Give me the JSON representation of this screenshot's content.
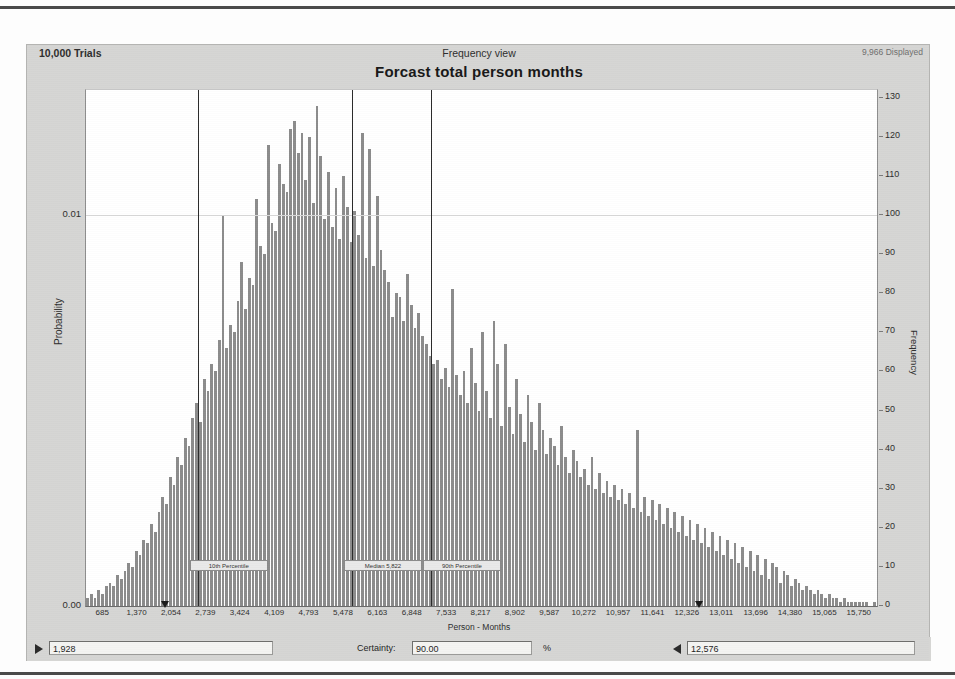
{
  "window": {
    "trials_label": "10,000 Trials",
    "view_label": "Frequency view",
    "displayed_label": "9,966 Displayed",
    "chart_title": "Forcast total person months"
  },
  "controls": {
    "lower_bound_value": "1,928",
    "certainty_label": "Certainty:",
    "certainty_value": "90.00",
    "percent_symbol": "%",
    "upper_bound_value": "12,576",
    "left_grabber_icon": "triangle-right-icon",
    "right_grabber_icon": "triangle-left-icon"
  },
  "annotations": [
    {
      "label": "10th Percentile",
      "x_value": 2568
    },
    {
      "label": "Median 5,822",
      "x_value": 5640
    },
    {
      "label": "90th Percentile",
      "x_value": 7210
    }
  ],
  "chart_data": {
    "type": "bar",
    "title": "Forcast total person months",
    "subtitle": "Frequency view",
    "xlabel": "Person - Months",
    "ylabel": "Probability",
    "y2label": "Frequency",
    "ylim": [
      0,
      0.0132
    ],
    "y2lim": [
      0,
      132
    ],
    "xlim": [
      343,
      16092
    ],
    "grid": true,
    "legend": "none",
    "y_ticks_left": [
      "0.00",
      "0.01"
    ],
    "y_tick_values_left": [
      0.0,
      0.01
    ],
    "y_ticks_right": [
      "0",
      "10",
      "20",
      "30",
      "40",
      "50",
      "60",
      "70",
      "80",
      "90",
      "100",
      "110",
      "120",
      "130"
    ],
    "y_tick_values_right": [
      0,
      10,
      20,
      30,
      40,
      50,
      60,
      70,
      80,
      90,
      100,
      110,
      120,
      130
    ],
    "x_ticks": [
      "685",
      "1,370",
      "2,054",
      "2,739",
      "3,424",
      "4,109",
      "4,793",
      "5,478",
      "6,163",
      "6,848",
      "7,533",
      "8,217",
      "8,902",
      "9,587",
      "10,272",
      "10,957",
      "11,641",
      "12,326",
      "13,011",
      "13,696",
      "14,380",
      "15,065",
      "15,750"
    ],
    "x_tick_values": [
      685,
      1370,
      2054,
      2739,
      3424,
      4109,
      4793,
      5478,
      6163,
      6848,
      7533,
      8217,
      8902,
      9587,
      10272,
      10957,
      11641,
      12326,
      13011,
      13696,
      14380,
      15065,
      15750
    ],
    "bin_width": 105,
    "values": [
      2,
      3,
      2,
      4,
      3,
      5,
      6,
      5,
      8,
      7,
      9,
      11,
      10,
      14,
      13,
      17,
      16,
      21,
      19,
      24,
      28,
      26,
      33,
      31,
      38,
      36,
      43,
      41,
      48,
      52,
      47,
      58,
      55,
      62,
      60,
      68,
      100,
      66,
      72,
      70,
      78,
      88,
      76,
      84,
      82,
      104,
      92,
      90,
      118,
      98,
      96,
      113,
      108,
      106,
      122,
      124,
      116,
      121,
      109,
      120,
      103,
      128,
      115,
      99,
      111,
      97,
      107,
      94,
      110,
      102,
      93,
      101,
      95,
      121,
      89,
      117,
      87,
      105,
      91,
      86,
      83,
      74,
      80,
      79,
      73,
      85,
      77,
      71,
      75,
      69,
      67,
      64,
      62,
      63,
      58,
      61,
      56,
      81,
      59,
      54,
      60,
      52,
      66,
      57,
      50,
      70,
      55,
      48,
      73,
      62,
      46,
      67,
      51,
      44,
      58,
      49,
      42,
      54,
      47,
      40,
      52,
      45,
      39,
      43,
      41,
      36,
      46,
      38,
      34,
      40,
      37,
      33,
      35,
      31,
      38,
      30,
      34,
      29,
      32,
      28,
      31,
      27,
      30,
      26,
      29,
      25,
      45,
      24,
      28,
      23,
      27,
      22,
      26,
      21,
      25,
      20,
      24,
      19,
      23,
      18,
      22,
      17,
      21,
      16,
      20,
      15,
      19,
      14,
      18,
      13,
      17,
      12,
      16,
      11,
      15,
      10,
      14,
      9,
      13,
      8,
      12,
      7,
      11,
      10,
      6,
      9,
      8,
      5,
      7,
      6,
      4,
      5,
      4,
      3,
      4,
      3,
      2,
      3,
      2,
      2,
      1,
      2,
      1,
      1,
      1,
      1,
      1,
      1,
      0,
      1
    ]
  }
}
